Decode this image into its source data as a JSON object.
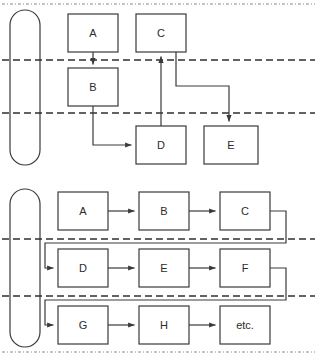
{
  "figure": {
    "type": "flowchart-swimlane-diagram",
    "background_color": "#ffffff",
    "stroke_color": "#3a3a3a",
    "dashed_color": "#2f2f2f",
    "text_color": "#2b2b2b",
    "panel_count": 2
  },
  "panels": [
    {
      "id": "upper-panel",
      "name": "upper-diagram",
      "lane_marker": {
        "name": "lane-bracket",
        "shape": "rounded-rectangle"
      },
      "lane_divider_count": 2,
      "boxes": [
        {
          "id": "u-a",
          "label": "A",
          "x": 68,
          "y": 14,
          "w": 50,
          "h": 38
        },
        {
          "id": "u-c",
          "label": "C",
          "x": 136,
          "y": 14,
          "w": 50,
          "h": 38
        },
        {
          "id": "u-b",
          "label": "B",
          "x": 68,
          "y": 68,
          "w": 50,
          "h": 38
        },
        {
          "id": "u-d",
          "label": "D",
          "x": 136,
          "y": 126,
          "w": 50,
          "h": 38
        },
        {
          "id": "u-e",
          "label": "E",
          "x": 204,
          "y": 126,
          "w": 54,
          "h": 38
        }
      ],
      "connections": [
        {
          "from": "A",
          "to": "B",
          "style": "straight-down"
        },
        {
          "from": "B",
          "to": "D",
          "style": "down-then-right"
        },
        {
          "from": "D",
          "to": "C",
          "style": "straight-up"
        },
        {
          "from": "C",
          "to": "E",
          "style": "down-right-down"
        }
      ]
    },
    {
      "id": "lower-panel",
      "name": "lower-diagram",
      "lane_marker": {
        "name": "lane-bracket",
        "shape": "rounded-rectangle"
      },
      "lane_divider_count": 2,
      "rows": [
        {
          "id": "row-1",
          "boxes": [
            {
              "id": "l-a",
              "label": "A",
              "x": 58,
              "y": 192,
              "w": 50,
              "h": 38
            },
            {
              "id": "l-b",
              "label": "B",
              "x": 139,
              "y": 192,
              "w": 50,
              "h": 38
            },
            {
              "id": "l-c",
              "label": "C",
              "x": 220,
              "y": 192,
              "w": 50,
              "h": 38
            }
          ]
        },
        {
          "id": "row-2",
          "boxes": [
            {
              "id": "l-d",
              "label": "D",
              "x": 58,
              "y": 249,
              "w": 50,
              "h": 38
            },
            {
              "id": "l-e",
              "label": "E",
              "x": 139,
              "y": 249,
              "w": 50,
              "h": 38
            },
            {
              "id": "l-f",
              "label": "F",
              "x": 220,
              "y": 249,
              "w": 50,
              "h": 38
            }
          ]
        },
        {
          "id": "row-3",
          "boxes": [
            {
              "id": "l-g",
              "label": "G",
              "x": 58,
              "y": 306,
              "w": 50,
              "h": 38
            },
            {
              "id": "l-h",
              "label": "H",
              "x": 139,
              "y": 306,
              "w": 50,
              "h": 38
            },
            {
              "id": "l-etc",
              "label": "etc.",
              "x": 220,
              "y": 306,
              "w": 50,
              "h": 38
            }
          ]
        }
      ],
      "connections": [
        {
          "from": "A",
          "to": "B",
          "style": "right"
        },
        {
          "from": "B",
          "to": "C",
          "style": "right"
        },
        {
          "from": "C",
          "to": "D",
          "style": "wrap-to-next-row"
        },
        {
          "from": "D",
          "to": "E",
          "style": "right"
        },
        {
          "from": "E",
          "to": "F",
          "style": "right"
        },
        {
          "from": "F",
          "to": "G",
          "style": "wrap-to-next-row"
        },
        {
          "from": "G",
          "to": "H",
          "style": "right"
        },
        {
          "from": "H",
          "to": "etc.",
          "style": "right"
        }
      ]
    }
  ],
  "labels": {
    "upper": {
      "a": "A",
      "b": "B",
      "c": "C",
      "d": "D",
      "e": "E"
    },
    "lower": {
      "a": "A",
      "b": "B",
      "c": "C",
      "d": "D",
      "e": "E",
      "f": "F",
      "g": "G",
      "h": "H",
      "etc": "etc."
    }
  }
}
